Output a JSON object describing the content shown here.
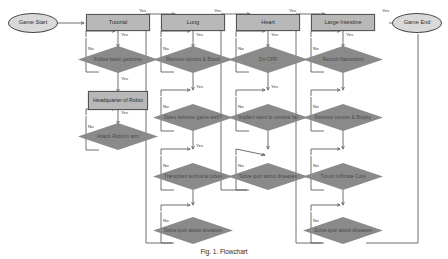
{
  "figure": {
    "caption": "Fig. 1.  Flowchart",
    "background": "#ffffff",
    "colors": {
      "process_fill": "#b8b8b8",
      "decision_fill": "#8a8a8a",
      "terminal_fill": "#d9d9d9",
      "line": "#4d4d4d",
      "text": "#333333"
    }
  },
  "nodes": {
    "start": "Game Start",
    "end": "Game End",
    "tutorial": "Tutorial",
    "lung": "Lung",
    "heart": "Heart",
    "large_intestine": "Large Intestine",
    "headquarter": "Headquarter of Robot"
  },
  "columns": [
    {
      "id": "tutorial",
      "header": "Tutorial",
      "steps": [
        {
          "label": "Follow basic gestures",
          "yes": "Yes",
          "no": "No"
        },
        {
          "label": "Headquarter of Robot",
          "type": "process"
        },
        {
          "label": "Attack Robot's arm",
          "yes": "Yes",
          "no": "No"
        }
      ]
    },
    {
      "id": "lung",
      "header": "Lung",
      "entry_label": "Yes",
      "steps": [
        {
          "label": "Remove tumors & Blood",
          "yes": "Yes",
          "no": "No"
        },
        {
          "label": "Does defence game well?",
          "yes": "Yes",
          "no": "No"
        },
        {
          "label": "Transplant technical tubes",
          "yes": "Yes",
          "no": "No"
        },
        {
          "label": "Solve quiz about diseases",
          "yes": "Yes",
          "no": "No"
        }
      ]
    },
    {
      "id": "heart",
      "header": "Heart",
      "entry_label": "Yes",
      "steps": [
        {
          "label": "Do CPR",
          "yes": "Yes",
          "no": "No"
        },
        {
          "label": "Implant stent to remove fat",
          "yes": "Yes",
          "no": "No"
        },
        {
          "label": "Solve quiz about diseases",
          "yes": "Yes",
          "no": "No"
        }
      ]
    },
    {
      "id": "large-intestine",
      "header": "Large Intestine",
      "entry_label": "Yes",
      "steps": [
        {
          "label": "Recruit Nanorobot",
          "yes": "Yes",
          "no": "No"
        },
        {
          "label": "Remove tumors & Biopsy",
          "yes": "Yes",
          "no": "No"
        },
        {
          "label": "Tumor Infiltrate Cure",
          "yes": "Yes",
          "no": "No"
        },
        {
          "label": "Solve quiz about diseases",
          "yes": "Yes",
          "no": "No"
        }
      ]
    }
  ],
  "edge_labels": {
    "yes": "Yes",
    "no": "No"
  },
  "exit_label": "Yes"
}
